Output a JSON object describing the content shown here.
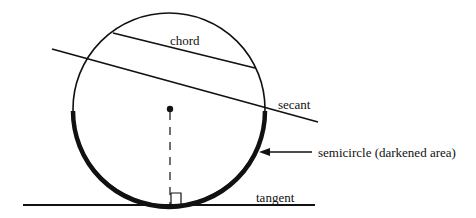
{
  "diagram": {
    "labels": {
      "chord": "chord",
      "secant": "secant",
      "semicircle": "semicircle (darkened area)",
      "tangent": "tangent"
    },
    "colors": {
      "stroke": "#111111",
      "background": "#ffffff"
    },
    "geometry": {
      "circle": {
        "cx": 169,
        "cy": 109,
        "r": 96
      },
      "chord": {
        "x1": 113,
        "y1": 33,
        "x2": 255,
        "y2": 68
      },
      "secant": {
        "x1": 52,
        "y1": 49,
        "x2": 318,
        "y2": 122
      },
      "tangent": {
        "x1": 23,
        "y1": 205,
        "x2": 315,
        "y2": 205
      },
      "radius_dashed": {
        "x1": 170,
        "y1": 109,
        "x2": 170,
        "y2": 205
      },
      "arrow": {
        "x1": 312,
        "y1": 152,
        "x2": 260,
        "y2": 152
      }
    }
  }
}
